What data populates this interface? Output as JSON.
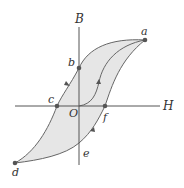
{
  "diagram": {
    "axes": {
      "x_label": "H",
      "y_label": "B",
      "origin_label": "O"
    },
    "points": [
      {
        "id": "a",
        "label": "a"
      },
      {
        "id": "b",
        "label": "b"
      },
      {
        "id": "c",
        "label": "c"
      },
      {
        "id": "d",
        "label": "d"
      },
      {
        "id": "e",
        "label": "e"
      },
      {
        "id": "f",
        "label": "f"
      }
    ],
    "colors": {
      "fill": "#e6e6e6",
      "curve": "#666666",
      "axis": "#555555",
      "point": "#555555"
    }
  }
}
